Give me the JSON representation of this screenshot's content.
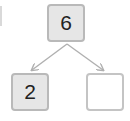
{
  "diagram": {
    "type": "number-bond",
    "top": {
      "value": "6"
    },
    "children": [
      {
        "value": "2"
      },
      {
        "value": ""
      }
    ],
    "colors": {
      "filled_box": "#e6e6e6",
      "border": "#b9b9b9",
      "arrow": "#b0b0b0"
    }
  }
}
